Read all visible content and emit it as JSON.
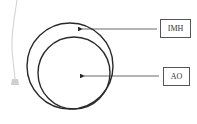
{
  "diagram": {
    "labels": {
      "imh": "IMH",
      "ao": "AO"
    },
    "colors": {
      "stroke": "#2a2a2a",
      "catheter": "#c8c8c8",
      "box_border": "#555555"
    },
    "shapes": [
      {
        "name": "outer-circle",
        "cx": 70,
        "cy": 66,
        "r": 43
      },
      {
        "name": "inner-circle",
        "cx": 74,
        "cy": 73,
        "r": 36
      }
    ],
    "arrows": [
      {
        "label": "IMH",
        "from": [
          157,
          29
        ],
        "to": [
          79,
          29
        ]
      },
      {
        "label": "AO",
        "from": [
          159,
          76
        ],
        "to": [
          81,
          76
        ]
      }
    ]
  }
}
